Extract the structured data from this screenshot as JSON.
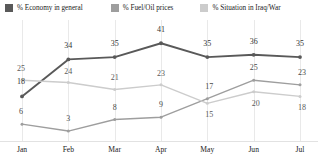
{
  "chart_data": {
    "type": "line",
    "title": "",
    "xlabel": "",
    "ylabel": "",
    "categories": [
      "Jan",
      "Feb",
      "Mar",
      "Apr",
      "May",
      "Jun",
      "Jul"
    ],
    "ylim": [
      0,
      45
    ],
    "grid": true,
    "legend_position": "top",
    "show_data_labels": true,
    "series": [
      {
        "name": "% Economy in general",
        "color": "#595959",
        "values": [
          18,
          34,
          35,
          41,
          35,
          36,
          35
        ]
      },
      {
        "name": "% Fuel/Oil prices",
        "color": "#9e9e9e",
        "values": [
          6,
          3,
          8,
          9,
          17,
          25,
          23
        ]
      },
      {
        "name": "% Situation in Iraq/War",
        "color": "#cccccc",
        "values": [
          25,
          24,
          21,
          23,
          15,
          20,
          18
        ]
      }
    ]
  },
  "legend": {
    "items": [
      {
        "label": "% Economy in general",
        "swatch": "#595959"
      },
      {
        "label": "% Fuel/Oil prices",
        "swatch": "#9e9e9e"
      },
      {
        "label": "% Situation in Iraq/War",
        "swatch": "#cccccc"
      }
    ]
  },
  "axis": {
    "x_ticks": [
      "Jan",
      "Feb",
      "Mar",
      "Apr",
      "May",
      "Jun",
      "Jul"
    ]
  }
}
